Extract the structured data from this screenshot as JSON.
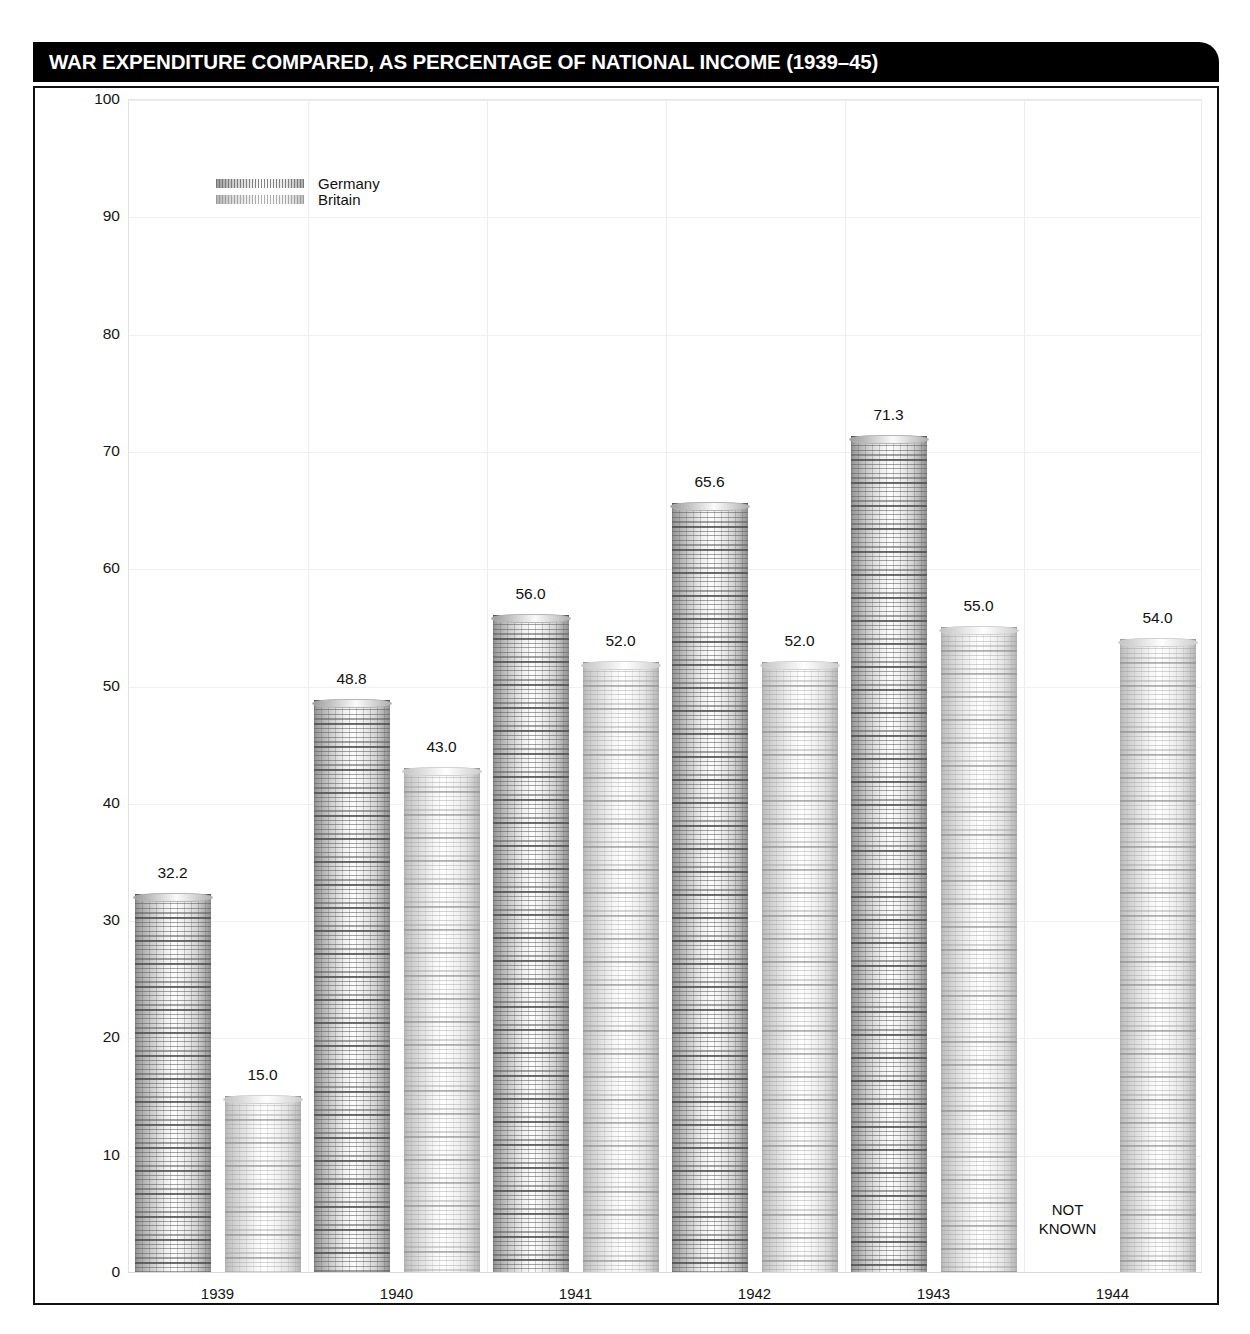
{
  "header": {
    "title": "WAR EXPENDITURE COMPARED, AS PERCENTAGE OF NATIONAL INCOME (1939–45)"
  },
  "legend": {
    "items": [
      {
        "label": "Germany",
        "swatch": "coin-stack-dark"
      },
      {
        "label": "Britain",
        "swatch": "coin-stack-light"
      }
    ]
  },
  "annotations": {
    "not_known_line1": "NOT",
    "not_known_line2": "KNOWN"
  },
  "chart_data": {
    "type": "bar",
    "title": "WAR EXPENDITURE COMPARED, AS PERCENTAGE OF NATIONAL INCOME (1939–45)",
    "xlabel": "",
    "ylabel": "",
    "ylim": [
      0,
      100
    ],
    "yticks": [
      0,
      10,
      20,
      30,
      40,
      50,
      60,
      70,
      80,
      90,
      100
    ],
    "ytick_labels": [
      "0",
      "10",
      "20",
      "30",
      "40",
      "50",
      "60",
      "70",
      "80",
      "90",
      "100"
    ],
    "categories": [
      "1939",
      "1940",
      "1941",
      "1942",
      "1943",
      "1944"
    ],
    "grid": true,
    "legend_position": "top-left-inside",
    "series": [
      {
        "name": "Germany",
        "color": "#a0a0a0",
        "values": [
          32.2,
          48.8,
          56.0,
          65.6,
          71.3,
          null
        ],
        "labels": [
          "32.2",
          "48.8",
          "56.0",
          "65.6",
          "71.3",
          "NOT KNOWN"
        ]
      },
      {
        "name": "Britain",
        "color": "#d0d0d0",
        "values": [
          15.0,
          43.0,
          52.0,
          52.0,
          55.0,
          54.0
        ],
        "labels": [
          "15.0",
          "43.0",
          "52.0",
          "52.0",
          "55.0",
          "54.0"
        ]
      }
    ]
  }
}
